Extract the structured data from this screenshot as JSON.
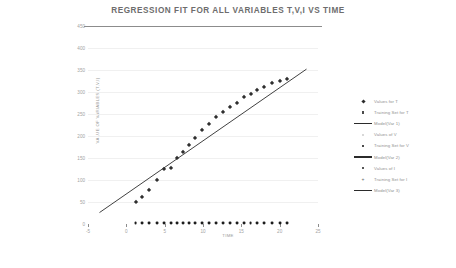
{
  "chart_data": {
    "type": "scatter",
    "title": "REGRESSION FIT FOR ALL VARIABLES T,V,I VS TIME",
    "xlabel": "TIME",
    "ylabel": "VALUE OF VARIABLES (T,V,I)",
    "xlim": [
      -5,
      25
    ],
    "ylim": [
      0,
      450
    ],
    "grid": true,
    "legend_position": "right",
    "xticks": [
      -5,
      0,
      5,
      10,
      15,
      20,
      25
    ],
    "xtick_labels": [
      "-5",
      "0",
      "5",
      "10",
      "15",
      "20",
      "25"
    ],
    "yticks": [
      0,
      50,
      100,
      150,
      200,
      250,
      300,
      350,
      400,
      450
    ],
    "ytick_labels": [
      "0",
      "50",
      "100",
      "150",
      "200",
      "250",
      "300",
      "350",
      "400",
      "450"
    ],
    "series": [
      {
        "name": "Values for T",
        "marker": "diamond",
        "x": [
          1.2,
          2.1,
          3.0,
          4.0,
          4.9,
          5.8,
          6.6,
          7.4,
          8.2,
          9.0,
          9.9,
          10.8,
          11.7,
          12.6,
          13.5,
          14.4,
          15.3,
          16.2,
          17.1,
          18.0,
          19.0,
          20.0,
          21.0
        ],
        "y": [
          50,
          62,
          78,
          100,
          126,
          128,
          150,
          163,
          180,
          196,
          214,
          228,
          244,
          254,
          266,
          276,
          288,
          296,
          304,
          312,
          320,
          326,
          330
        ]
      },
      {
        "name": "Model(Var 1)",
        "type": "line",
        "x": [
          -3.5,
          23.5
        ],
        "y": [
          26,
          352
        ]
      },
      {
        "name": "Values of I",
        "marker": "circle",
        "x": [
          1.2,
          2.1,
          3.0,
          4.0,
          4.9,
          5.8,
          6.6,
          7.4,
          8.2,
          9.0,
          9.9,
          10.8,
          11.7,
          12.6,
          13.5,
          14.4,
          15.3,
          16.2,
          17.1,
          18.0,
          19.0,
          20.0,
          21.0
        ],
        "y": [
          2,
          2,
          2,
          2,
          2,
          2,
          2,
          2,
          2,
          2,
          2,
          2,
          2,
          2,
          2,
          2,
          2,
          2,
          2,
          2,
          2,
          2,
          2
        ]
      }
    ],
    "legend_entries": [
      {
        "label": "Values for T",
        "mark": "diamond"
      },
      {
        "label": "Training Set for T",
        "mark": "square"
      },
      {
        "label": "Model(Var 1)",
        "mark": "line"
      },
      {
        "label": "Values of V",
        "mark": "square-light"
      },
      {
        "label": "Training Set for V",
        "mark": "square"
      },
      {
        "label": "Model(Var 2)",
        "mark": "line"
      },
      {
        "label": "Values of I",
        "mark": "dot"
      },
      {
        "label": "Training Set for I",
        "mark": "plus"
      },
      {
        "label": "Model(Var 3)",
        "mark": "line"
      }
    ],
    "colors": {
      "title": "#6d6d6d",
      "tick": "#a3a3a3",
      "grid": "#f0f0f0",
      "axis": "#8c8c8c",
      "marker": "#2f2f2f",
      "line": "#2b2b2b"
    }
  }
}
